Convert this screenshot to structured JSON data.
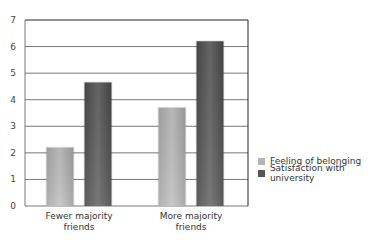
{
  "chart_data": {
    "type": "bar",
    "title": "",
    "xlabel": "",
    "ylabel": "",
    "ylim": [
      0,
      7
    ],
    "yticks": [
      0,
      1,
      2,
      3,
      4,
      5,
      6,
      7
    ],
    "grid": true,
    "legend_position": "right",
    "categories": [
      "Fewer majority friends",
      "More majority friends"
    ],
    "category_lines": [
      [
        "Fewer majority",
        "friends"
      ],
      [
        "More majority",
        "friends"
      ]
    ],
    "series": [
      {
        "name": "Feeling of belonging",
        "color": "#b5b5b5",
        "values": [
          2.2,
          3.7
        ]
      },
      {
        "name": "Satisfaction with university",
        "color": "#5a5a5a",
        "values": [
          4.65,
          6.2
        ]
      }
    ]
  }
}
